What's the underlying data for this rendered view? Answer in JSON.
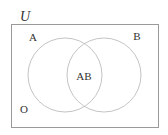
{
  "diagram": {
    "type": "venn",
    "universe_label": "U",
    "sets": [
      {
        "name": "A",
        "label": "A"
      },
      {
        "name": "B",
        "label": "B"
      }
    ],
    "intersection_label": "AB",
    "outside_label": "O",
    "colors": {
      "frame": "#9a9a9a",
      "circles": "#c4c4c4",
      "text": "#333333",
      "background": "#ffffff"
    }
  }
}
